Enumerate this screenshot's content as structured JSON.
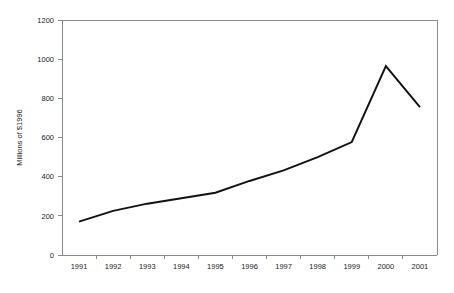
{
  "chart_data": {
    "type": "line",
    "title": "",
    "subtitle": "",
    "xlabel": "",
    "ylabel": "Millions of $1996",
    "categories": [
      "1991",
      "1992",
      "1993",
      "1994",
      "1995",
      "1996",
      "1997",
      "1998",
      "1999",
      "2000",
      "2001"
    ],
    "x": [
      1991,
      1992,
      1993,
      1994,
      1995,
      1996,
      1997,
      1998,
      1999,
      2000,
      2001
    ],
    "values": [
      170,
      225,
      262,
      290,
      318,
      378,
      432,
      500,
      577,
      965,
      755
    ],
    "series": [
      {
        "name": "",
        "values": [
          170,
          225,
          262,
          290,
          318,
          378,
          432,
          500,
          577,
          965,
          755
        ],
        "color": "#111111"
      }
    ],
    "ylim": [
      0,
      1200
    ],
    "yticks": [
      0,
      200,
      400,
      600,
      800,
      1000,
      1200
    ],
    "ytick_labels": [
      "0",
      "200",
      "400",
      "600",
      "800",
      "1000",
      "1200"
    ],
    "xtick_labels": [
      "1991",
      "1992",
      "1993",
      "1994",
      "1995",
      "1996",
      "1997",
      "1998",
      "1999",
      "2000",
      "2001"
    ],
    "grid": false,
    "legend": null,
    "legend_position": "none",
    "annotations": []
  },
  "style": {
    "axis_color": "#8a8a8a",
    "line_color": "#111111",
    "text_color": "#1a1a1a",
    "background": "#ffffff"
  }
}
